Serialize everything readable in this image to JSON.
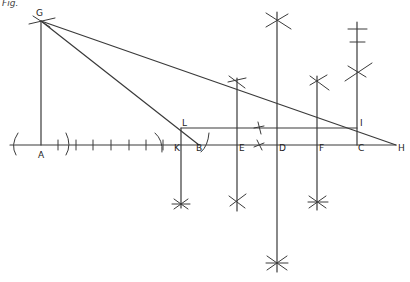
{
  "figure": {
    "caption_fragment": "Fig.",
    "points": {
      "G": {
        "label": "G",
        "x": 41,
        "y": 21
      },
      "A": {
        "label": "A",
        "x": 41,
        "y": 145
      },
      "K": {
        "label": "K",
        "x": 181,
        "y": 145
      },
      "B": {
        "label": "B",
        "x": 199,
        "y": 145
      },
      "L": {
        "label": "L",
        "x": 181,
        "y": 128
      },
      "E": {
        "label": "E",
        "x": 237,
        "y": 145
      },
      "D": {
        "label": "D",
        "x": 277,
        "y": 145
      },
      "F": {
        "label": "F",
        "x": 317,
        "y": 145
      },
      "C": {
        "label": "C",
        "x": 357,
        "y": 145
      },
      "I": {
        "label": "I",
        "x": 357,
        "y": 128
      },
      "H": {
        "label": "H",
        "x": 396,
        "y": 145
      }
    },
    "colors": {
      "line": "#3a3a3a",
      "label": "#222222",
      "background": "#ffffff"
    }
  }
}
